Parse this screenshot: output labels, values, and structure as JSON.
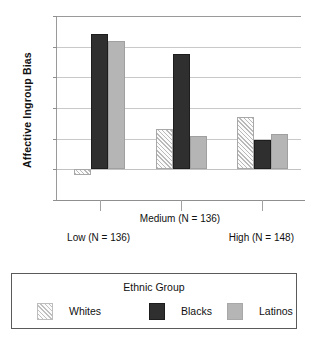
{
  "chart_data": {
    "type": "bar",
    "title": "",
    "xlabel": "",
    "ylabel": "Affective Ingroup Bias",
    "ylim": [
      -0.5,
      2.5
    ],
    "yticks": [
      "2.5",
      "2",
      "1.5",
      "1",
      "0.5",
      "0",
      "-0.5"
    ],
    "ytick_values": [
      2.5,
      2,
      1.5,
      1,
      0.5,
      0,
      -0.5
    ],
    "grid": true,
    "legend_position": "bottom",
    "legend_title": "Ethnic Group",
    "categories": [
      "Low (N = 136)",
      "Medium (N = 136)",
      "High (N = 148)"
    ],
    "series": [
      {
        "name": "Whites",
        "color": "#f2f2f2",
        "pattern": "diagonal-hatch",
        "values": [
          -0.1,
          0.65,
          0.85
        ]
      },
      {
        "name": "Blacks",
        "color": "#2f2f2f",
        "pattern": "solid",
        "values": [
          2.2,
          1.88,
          0.48
        ]
      },
      {
        "name": "Latinos",
        "color": "#b5b5b5",
        "pattern": "solid",
        "values": [
          2.1,
          0.55,
          0.58
        ]
      }
    ]
  },
  "axis": {
    "y_title": "Affective Ingroup Bias",
    "tick_labels": [
      "2.5",
      "2",
      "1.5",
      "1",
      "0.5",
      "0",
      "-0.5"
    ],
    "category_labels": [
      "Low (N = 136)",
      "Medium (N = 136)",
      "High (N = 148)"
    ]
  },
  "legend": {
    "title": "Ethnic Group",
    "entries": [
      {
        "label": "Whites"
      },
      {
        "label": "Blacks"
      },
      {
        "label": "Latinos"
      }
    ]
  }
}
